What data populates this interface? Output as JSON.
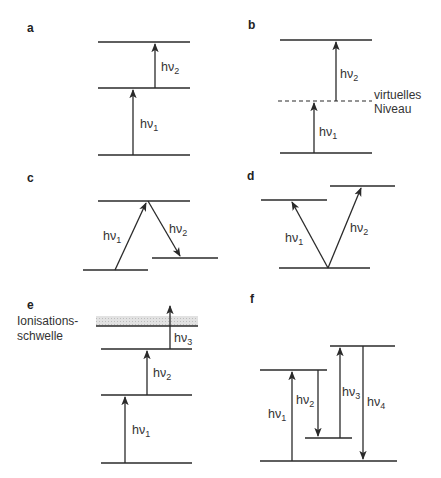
{
  "diagram": {
    "type": "energy-level diagrams (multiphoton processes)",
    "panels": [
      {
        "id": "a",
        "label": "a",
        "photons": [
          {
            "text": "hν",
            "sub": "1"
          },
          {
            "text": "hν",
            "sub": "2"
          }
        ]
      },
      {
        "id": "b",
        "label": "b",
        "photons": [
          {
            "text": "hν",
            "sub": "1"
          },
          {
            "text": "hν",
            "sub": "2"
          }
        ],
        "annotation": [
          "virtuelles",
          "Niveau"
        ]
      },
      {
        "id": "c",
        "label": "c",
        "photons": [
          {
            "text": "hν",
            "sub": "1"
          },
          {
            "text": "hν",
            "sub": "2"
          }
        ]
      },
      {
        "id": "d",
        "label": "d",
        "photons": [
          {
            "text": "hν",
            "sub": "1"
          },
          {
            "text": "hν",
            "sub": "2"
          }
        ]
      },
      {
        "id": "e",
        "label": "e",
        "photons": [
          {
            "text": "hν",
            "sub": "1"
          },
          {
            "text": "hν",
            "sub": "2"
          },
          {
            "text": "hν",
            "sub": "3"
          }
        ],
        "annotation": [
          "Ionisations-",
          "schwelle"
        ]
      },
      {
        "id": "f",
        "label": "f",
        "photons": [
          {
            "text": "hν",
            "sub": "1"
          },
          {
            "text": "hν",
            "sub": "2"
          },
          {
            "text": "hν",
            "sub": "3"
          },
          {
            "text": "hν",
            "sub": "4"
          }
        ]
      }
    ]
  },
  "colors": {
    "line": "#2a2a2a",
    "text": "#333333",
    "ionization_band": "#d4d4d4"
  }
}
